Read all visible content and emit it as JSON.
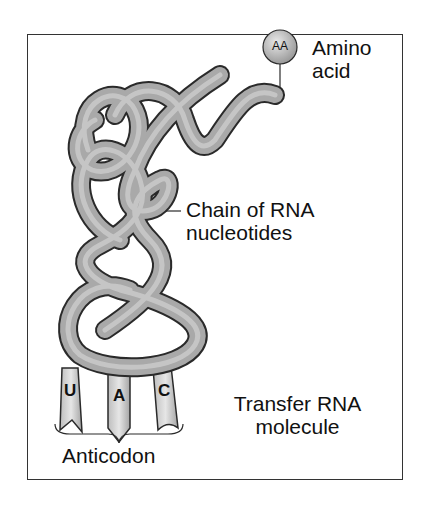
{
  "diagram": {
    "labels": {
      "amino_acid_badge": "AA",
      "amino_acid_line1": "Amino",
      "amino_acid_line2": "acid",
      "chain_line1": "Chain of RNA",
      "chain_line2": "nucleotides",
      "trna_line1": "Transfer RNA",
      "trna_line2": "molecule",
      "anticodon": "Anticodon"
    },
    "anticodon_bases": [
      "U",
      "A",
      "C"
    ],
    "colors": {
      "tube_fill": "#a9a9a9",
      "tube_outline": "#2a2a2a",
      "tube_highlight": "#d2d2d2",
      "frame": "#333333",
      "text": "#111111"
    }
  }
}
